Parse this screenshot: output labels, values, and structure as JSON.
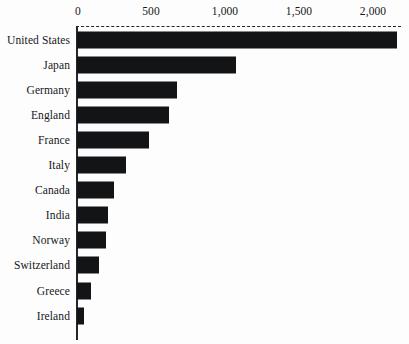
{
  "chart_data": {
    "type": "bar",
    "orientation": "horizontal",
    "title": "",
    "subtitle": "",
    "xlabel": "",
    "ylabel": "",
    "xlim": [
      0,
      2200
    ],
    "grid": false,
    "legend": null,
    "axis_position": "top",
    "axis_tick_labels": [
      "0",
      "500",
      "1,000",
      "1,500",
      "2,000"
    ],
    "axis_tick_values": [
      0,
      500,
      1000,
      1500,
      2000
    ],
    "bar_color": "#121416",
    "categories": [
      "United States",
      "Japan",
      "Germany",
      "England",
      "France",
      "Italy",
      "Canada",
      "India",
      "Norway",
      "Switzerland",
      "Greece",
      "Ireland"
    ],
    "values": [
      2155,
      1070,
      675,
      620,
      485,
      330,
      250,
      210,
      195,
      150,
      95,
      50
    ]
  }
}
